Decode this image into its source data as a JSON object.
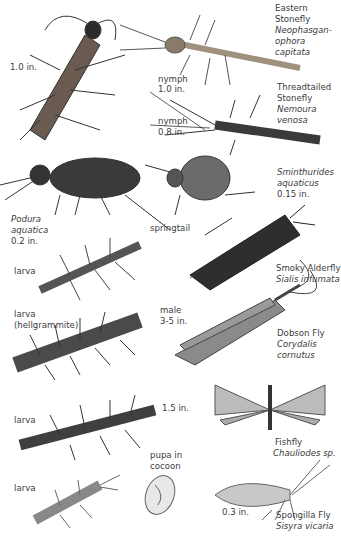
{
  "plate": {
    "background": "#ffffff",
    "ink_color": "#3a3a3a",
    "labels": {
      "adult_stonefly_size": "1.0 in.",
      "eastern_stonefly": {
        "common_1": "Eastern",
        "common_2": "Stonefly",
        "sci_1": "Neophasgan-",
        "sci_2": "ophora",
        "sci_3": "capitata"
      },
      "eastern_nymph": {
        "stage": "nymph",
        "size": "1.0 in."
      },
      "threadtailed_stonefly": {
        "common_1": "Threadtailed",
        "common_2": "Stonefly",
        "sci_1": "Nemoura",
        "sci_2": "venosa"
      },
      "threadtailed_nymph": {
        "stage": "nymph",
        "size": "0.8 in."
      },
      "sminthurides": {
        "sci_1": "Sminthurides",
        "sci_2": "aquaticus",
        "size": "0.15 in."
      },
      "podura": {
        "sci_1": "Podura",
        "sci_2": "aquatica",
        "size": "0.2 in."
      },
      "springtail": "springtail",
      "alderfly_larva": "larva",
      "smoky_alderfly": {
        "common": "Smoky Alderfly",
        "sci": "Sialis infumata"
      },
      "hellgrammite": {
        "line_1": "larva",
        "line_2": "(hellgrammite)"
      },
      "dobson_male": {
        "line_1": "male",
        "line_2": "3-5 in."
      },
      "dobson_fly": {
        "common": "Dobson Fly",
        "sci_1": "Corydalis",
        "sci_2": "cornutus"
      },
      "fishfly_larva": {
        "stage": "larva",
        "size": "1.5 in."
      },
      "fishfly": {
        "common": "Fishfly",
        "sci": "Chauliodes sp."
      },
      "pupa": {
        "line_1": "pupa in",
        "line_2": "cocoon"
      },
      "spongilla_larva": "larva",
      "spongilla_size": "0.3 in.",
      "spongilla_fly": {
        "common": "Spongilla Fly",
        "sci": "Sisyra vicaria"
      }
    }
  }
}
